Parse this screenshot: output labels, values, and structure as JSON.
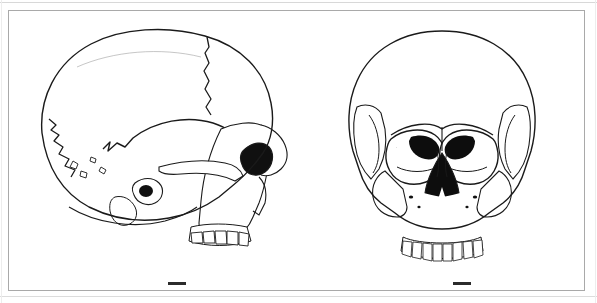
{
  "plate": {
    "background_color": "#ffffff",
    "frame_color": "#a9a9a9",
    "ink_color": "#1a1a1a",
    "width_px": 597,
    "height_px": 303
  },
  "figures": [
    {
      "id": "lateral",
      "view_label": "Lateral view of human skull",
      "position": "left",
      "scale_bar": {
        "label": "scale bar",
        "length_px": 18,
        "color": "#2b2b2b"
      }
    },
    {
      "id": "frontal",
      "view_label": "Frontal view of human skull",
      "position": "right",
      "scale_bar": {
        "label": "scale bar",
        "length_px": 18,
        "color": "#2b2b2b"
      }
    }
  ],
  "chart_data": {
    "type": "table",
    "title": "",
    "categories": [
      "lateral view",
      "frontal view"
    ],
    "values": [
      1,
      1
    ]
  }
}
